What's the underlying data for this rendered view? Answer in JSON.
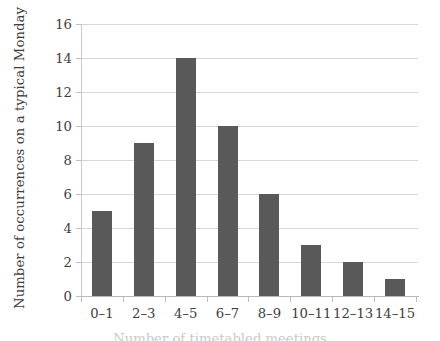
{
  "chart_data": {
    "type": "bar",
    "title": "",
    "subtitle": "",
    "xlabel": "Number of timetabled meetings",
    "ylabel": "Number of occurrences on a typical Monday",
    "categories": [
      "0–1",
      "2–3",
      "4–5",
      "6–7",
      "8–9",
      "10–11",
      "12–13",
      "14–15"
    ],
    "values": [
      5,
      9,
      14,
      10,
      6,
      3,
      2,
      1
    ],
    "ylim": [
      0,
      16
    ],
    "ytick_step": 2,
    "ytick_labels": [
      "0",
      "2",
      "4",
      "6",
      "8",
      "10",
      "12",
      "14",
      "16"
    ],
    "grid": "horizontal",
    "legend": "none",
    "bar_color": "#595959",
    "grid_color": "#d7d7d7",
    "axis_color": "#b8b8b8",
    "background": "#ffffff"
  }
}
